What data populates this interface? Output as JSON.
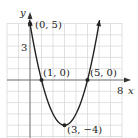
{
  "chart_data": {
    "type": "line",
    "title": "",
    "xlabel": "x",
    "ylabel": "y",
    "function": "y = x^2 - 6x + 5",
    "xlim": [
      -2,
      8.5
    ],
    "ylim": [
      -5,
      5.2
    ],
    "grid": true,
    "x_ticks_labeled": [
      8
    ],
    "y_ticks_labeled": [
      3
    ],
    "series": [
      {
        "name": "parabola",
        "x": [
          0,
          0.5,
          1,
          1.5,
          2,
          2.5,
          3,
          3.5,
          4,
          4.5,
          5,
          5.5,
          6
        ],
        "y": [
          5,
          2.25,
          0,
          -1.75,
          -3,
          -3.75,
          -4,
          -3.75,
          -3,
          -1.75,
          0,
          2.25,
          5
        ]
      }
    ],
    "annotations": [
      {
        "label": "(0, 5)",
        "x": 0,
        "y": 5
      },
      {
        "label": "(1, 0)",
        "x": 1,
        "y": 0
      },
      {
        "label": "(5, 0)",
        "x": 5,
        "y": 0
      },
      {
        "label": "(3, −4)",
        "x": 3,
        "y": -4
      }
    ]
  },
  "labels": {
    "x_axis": "x",
    "y_axis": "y",
    "x_tick": "8",
    "y_tick": "3",
    "pt_0_5": "(0, 5)",
    "pt_1_0": "(1, 0)",
    "pt_5_0": "(5, 0)",
    "pt_vertex": "(3, −4)"
  },
  "colors": {
    "curve": "#222222",
    "grid": "#d9d9d9",
    "axis": "#777777"
  }
}
